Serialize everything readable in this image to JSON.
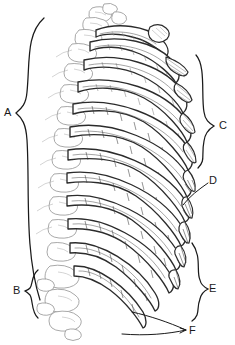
{
  "figure": {
    "style": "black-and-white engraving line art",
    "background_color": "#ffffff",
    "ink_color": "#1a1a1a",
    "secondary_ink_color": "#9a9a9a",
    "width": 235,
    "height": 345
  },
  "labels": [
    {
      "id": "A",
      "text": "A",
      "x": 8,
      "y": 113,
      "marker": "brace",
      "marker_side": "right",
      "span_start_y": 18,
      "span_end_y": 300,
      "region": "vertebral-column-and-posterior-rib-shafts"
    },
    {
      "id": "B",
      "text": "B",
      "x": 17,
      "y": 291,
      "marker": "brace",
      "marker_side": "right",
      "span_start_y": 270,
      "span_end_y": 318,
      "region": "lumbar-vertebrae"
    },
    {
      "id": "C",
      "text": "C",
      "x": 222,
      "y": 126,
      "marker": "brace",
      "marker_side": "left",
      "span_start_y": 55,
      "span_end_y": 168,
      "region": "true-ribs-costal-cartilages"
    },
    {
      "id": "D",
      "text": "D",
      "x": 212,
      "y": 181,
      "marker": "leader",
      "marker_side": "left",
      "region": "costochondral-junction"
    },
    {
      "id": "E",
      "text": "E",
      "x": 212,
      "y": 289,
      "marker": "brace",
      "marker_side": "left",
      "span_start_y": 243,
      "span_end_y": 321,
      "region": "false-ribs-costal-margin"
    },
    {
      "id": "F",
      "text": "F",
      "x": 191,
      "y": 331,
      "marker": "double-leader",
      "marker_side": "left",
      "region": "floating-ribs"
    }
  ],
  "ribs": [
    {
      "index": 1,
      "y_posterior": 46,
      "y_anterior": 56,
      "kind": "true"
    },
    {
      "index": 2,
      "y_posterior": 66,
      "y_anterior": 84,
      "kind": "true"
    },
    {
      "index": 3,
      "y_posterior": 88,
      "y_anterior": 112,
      "kind": "true"
    },
    {
      "index": 4,
      "y_posterior": 110,
      "y_anterior": 138,
      "kind": "true"
    },
    {
      "index": 5,
      "y_posterior": 132,
      "y_anterior": 164,
      "kind": "true"
    },
    {
      "index": 6,
      "y_posterior": 155,
      "y_anterior": 190,
      "kind": "true"
    },
    {
      "index": 7,
      "y_posterior": 178,
      "y_anterior": 215,
      "kind": "true"
    },
    {
      "index": 8,
      "y_posterior": 201,
      "y_anterior": 240,
      "kind": "false"
    },
    {
      "index": 9,
      "y_posterior": 224,
      "y_anterior": 264,
      "kind": "false"
    },
    {
      "index": 10,
      "y_posterior": 248,
      "y_anterior": 288,
      "kind": "false"
    },
    {
      "index": 11,
      "y_posterior": 272,
      "y_anterior": 312,
      "kind": "floating"
    },
    {
      "index": 12,
      "y_posterior": 293,
      "y_anterior": 326,
      "kind": "floating"
    }
  ],
  "vertebrae": {
    "count": 16,
    "top_y": 14,
    "bottom_y": 322,
    "x_center": 72
  }
}
